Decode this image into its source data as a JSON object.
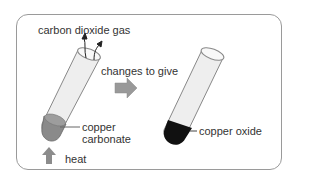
{
  "diagram": {
    "labels": {
      "gas": "carbon dioxide gas",
      "change": "changes to give",
      "reactant_line1": "copper",
      "reactant_line2": "carbonate",
      "heat": "heat",
      "product": "copper oxide"
    },
    "colors": {
      "frame": "#9a9a9a",
      "arrow": "#8c8c8c",
      "copper_carbonate": "#8a8a8a",
      "copper_oxide": "#111111",
      "tube_glass": "#eeeeee"
    }
  }
}
